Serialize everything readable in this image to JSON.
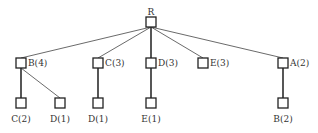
{
  "diagram": {
    "type": "tree",
    "root": {
      "id": "R",
      "label": "R",
      "x": 151,
      "y": 22
    },
    "level1": [
      {
        "id": "n_B4",
        "label": "B(4)",
        "x": 21,
        "y": 63,
        "label_pos": "right"
      },
      {
        "id": "n_C3",
        "label": "C(3)",
        "x": 98,
        "y": 63,
        "label_pos": "right"
      },
      {
        "id": "n_D3",
        "label": "D(3)",
        "x": 151,
        "y": 63,
        "label_pos": "right"
      },
      {
        "id": "n_E3",
        "label": "E(3)",
        "x": 203,
        "y": 63,
        "label_pos": "right"
      },
      {
        "id": "n_A2",
        "label": "A(2)",
        "x": 283,
        "y": 63,
        "label_pos": "right"
      }
    ],
    "level2": [
      {
        "id": "n_C2",
        "label": "C(2)",
        "x": 21,
        "y": 103,
        "parent": 0
      },
      {
        "id": "n_D1a",
        "label": "D(1)",
        "x": 60,
        "y": 103,
        "parent": 0
      },
      {
        "id": "n_D1b",
        "label": "D(1)",
        "x": 98,
        "y": 103,
        "parent": 1
      },
      {
        "id": "n_E1",
        "label": "E(1)",
        "x": 151,
        "y": 103,
        "parent": 2
      },
      {
        "id": "n_B2",
        "label": "B(2)",
        "x": 283,
        "y": 103,
        "parent": 4
      }
    ]
  }
}
